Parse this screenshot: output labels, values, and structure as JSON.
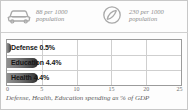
{
  "header": {
    "stats": [
      {
        "icon": "car-icon",
        "value": "88 per 1000",
        "unit": "population",
        "text": "88 per 1000\npopulation"
      },
      {
        "icon": "telephone-icon",
        "value": "230 per 1000",
        "unit": "population",
        "text": "230 per 1000\npopulation"
      }
    ]
  },
  "chart_data": {
    "type": "bar",
    "orientation": "horizontal",
    "title": "",
    "caption": "Defense, Health, Education spending as % of GDP",
    "categories": [
      "Defense",
      "Education",
      "Health"
    ],
    "values": [
      0.5,
      4.4,
      4.4
    ],
    "labels": [
      "Defense 0.5%",
      "Education 4.4%",
      "Health 4.4%"
    ],
    "xlabel": "",
    "ylabel": "",
    "xlim": [
      0,
      25
    ],
    "xticks": [
      0,
      5,
      10,
      15,
      20,
      25
    ],
    "xtick_labels": [
      "0",
      "5",
      "10",
      "15",
      "20",
      "25"
    ],
    "grid": true,
    "legend": false,
    "bar_color": "#4a4a4a"
  },
  "colors": {
    "frame_border": "#c8c8c8",
    "plot_border": "#9b9b9b",
    "grid": "#cfcfcf",
    "bar_dark": "#2b2b2b",
    "bar_light": "#8f8f8f",
    "stat_text": "#8e8e8e",
    "caption_text": "#5d5d5d",
    "tick_text": "#6f6f6f"
  }
}
